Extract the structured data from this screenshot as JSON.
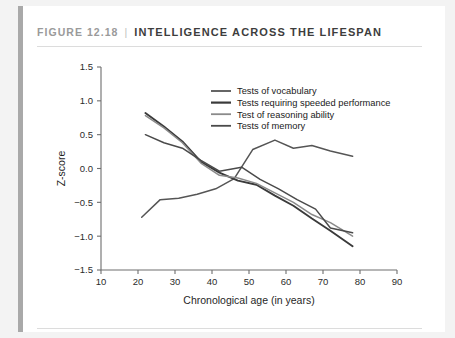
{
  "figure": {
    "number_label": "FIGURE 12.18",
    "separator": "|",
    "title": "INTELLIGENCE ACROSS THE LIFESPAN"
  },
  "colors": {
    "frame_gutter": "#f3f3f3",
    "left_rule": "#a9a9a9",
    "divider": "#dcdcdc",
    "figure_number_text": "#9a9a9a",
    "title_text": "#3d3d3d",
    "axis": "#6e6e6e",
    "series_vocabulary": "#555555",
    "series_speeded": "#3a3a3a",
    "series_reasoning": "#8a8a8a",
    "series_memory": "#4a4a4a"
  },
  "chart_data": {
    "type": "line",
    "title": "INTELLIGENCE ACROSS THE LIFESPAN",
    "xlabel": "Chronological age (in years)",
    "ylabel": "Z-score",
    "xlim": [
      10,
      90
    ],
    "ylim": [
      -1.5,
      1.5
    ],
    "xticks": [
      10,
      20,
      30,
      40,
      50,
      60,
      70,
      80,
      90
    ],
    "yticks": [
      -1.5,
      -1.0,
      -0.5,
      0.0,
      0.5,
      1.0,
      1.5
    ],
    "xtick_labels": [
      "10",
      "20",
      "30",
      "40",
      "50",
      "60",
      "70",
      "80",
      "90"
    ],
    "ytick_labels": [
      "-1.5",
      "-1.0",
      "-0.5",
      "0.0",
      "0.5",
      "1.0",
      "1.5"
    ],
    "grid": false,
    "legend_position": "upper center",
    "series": [
      {
        "name": "Tests of vocabulary",
        "color": "#555555",
        "width": 1.5,
        "x": [
          21,
          26,
          31,
          36,
          41,
          46,
          51,
          57,
          62,
          67,
          72,
          78
        ],
        "y": [
          -0.72,
          -0.46,
          -0.44,
          -0.38,
          -0.3,
          -0.15,
          0.28,
          0.42,
          0.3,
          0.34,
          0.26,
          0.18
        ]
      },
      {
        "name": "Tests requiring speeded performance",
        "color": "#3a3a3a",
        "width": 1.9,
        "x": [
          22,
          27,
          32,
          37,
          42,
          47,
          52,
          57,
          62,
          67,
          72,
          78
        ],
        "y": [
          0.82,
          0.62,
          0.4,
          0.1,
          -0.06,
          -0.18,
          -0.24,
          -0.4,
          -0.55,
          -0.74,
          -0.92,
          -1.15
        ]
      },
      {
        "name": "Test of reasoning ability",
        "color": "#8a8a8a",
        "width": 1.5,
        "x": [
          22,
          27,
          32,
          37,
          42,
          47,
          52,
          57,
          62,
          67,
          72,
          78
        ],
        "y": [
          0.78,
          0.6,
          0.38,
          0.08,
          -0.1,
          -0.14,
          -0.22,
          -0.36,
          -0.5,
          -0.68,
          -0.8,
          -1.0
        ]
      },
      {
        "name": "Tests of memory",
        "color": "#4a4a4a",
        "width": 1.5,
        "x": [
          22,
          27,
          32,
          37,
          42,
          48,
          53,
          58,
          63,
          68,
          72,
          78
        ],
        "y": [
          0.5,
          0.38,
          0.3,
          0.12,
          -0.04,
          0.02,
          -0.16,
          -0.3,
          -0.46,
          -0.6,
          -0.88,
          -0.95
        ]
      }
    ]
  }
}
